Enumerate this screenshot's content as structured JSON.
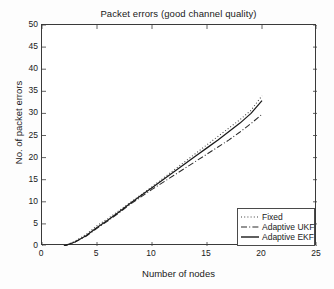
{
  "chart_data": {
    "type": "line",
    "title": "Packet errors (good channel quality)",
    "xlabel": "Number of nodes",
    "ylabel": "No. of packet errors",
    "xlim": [
      0,
      25
    ],
    "ylim": [
      0,
      50
    ],
    "xticks": [
      0,
      5,
      10,
      15,
      20,
      25
    ],
    "yticks": [
      0,
      5,
      10,
      15,
      20,
      25,
      30,
      35,
      40,
      45,
      50
    ],
    "grid": false,
    "legend_position": "lower right",
    "series": [
      {
        "name": "Fixed",
        "style": "dotted",
        "color": "#404040",
        "x": [
          2,
          3,
          4,
          5,
          6,
          7,
          8,
          9,
          10,
          11,
          12,
          13,
          14,
          15,
          16,
          17,
          18,
          19,
          20
        ],
        "y": [
          0,
          1.1,
          2.6,
          4.6,
          6.2,
          8.0,
          9.8,
          11.6,
          13.4,
          15.3,
          17.2,
          19.1,
          21.0,
          22.9,
          24.8,
          26.7,
          28.6,
          30.7,
          34.0
        ]
      },
      {
        "name": "Adaptive UKF",
        "style": "dash-dot",
        "color": "#2a2a2a",
        "x": [
          2,
          3,
          4,
          5,
          6,
          7,
          8,
          9,
          10,
          11,
          12,
          13,
          14,
          15,
          16,
          17,
          18,
          19,
          20
        ],
        "y": [
          0,
          0.9,
          2.2,
          4.0,
          5.7,
          7.5,
          9.4,
          11.1,
          12.8,
          14.4,
          16.0,
          17.6,
          19.2,
          20.8,
          22.4,
          24.0,
          25.8,
          27.7,
          29.8
        ]
      },
      {
        "name": "Adaptive EKF",
        "style": "solid",
        "color": "#1a1a1a",
        "x": [
          2,
          3,
          4,
          5,
          6,
          7,
          8,
          9,
          10,
          11,
          12,
          13,
          14,
          15,
          16,
          17,
          18,
          19,
          20
        ],
        "y": [
          0,
          0.9,
          2.3,
          4.2,
          5.9,
          7.7,
          9.6,
          11.4,
          13.2,
          15.0,
          16.8,
          18.6,
          20.4,
          22.2,
          24.0,
          25.9,
          27.8,
          30.0,
          32.9
        ]
      }
    ]
  },
  "legend": {
    "items": [
      {
        "label": "Fixed"
      },
      {
        "label": "Adaptive UKF"
      },
      {
        "label": "Adaptive EKF"
      }
    ]
  }
}
